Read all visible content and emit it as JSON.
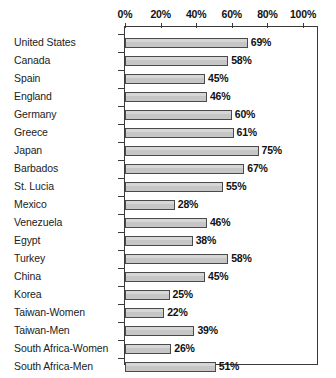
{
  "chart_data": {
    "type": "bar",
    "orientation": "horizontal",
    "title": "",
    "xlabel": "",
    "ylabel": "",
    "xlim": [
      0,
      100
    ],
    "xtick_labels": [
      "0%",
      "20%",
      "40%",
      "60%",
      "80%",
      "100%"
    ],
    "xticks": [
      0,
      20,
      40,
      60,
      80,
      100
    ],
    "grid": false,
    "legend": "none",
    "value_suffix": "%",
    "bar_fill_color": "#c6c6c6",
    "bar_border_color": "#4a4a4a",
    "axis_color": "#3a3a3a",
    "categories": [
      "United States",
      "Canada",
      "Spain",
      "England",
      "Germany",
      "Greece",
      "Japan",
      "Barbados",
      "St. Lucia",
      "Mexico",
      "Venezuela",
      "Egypt",
      "Turkey",
      "China",
      "Korea",
      "Taiwan-Women",
      "Taiwan-Men",
      "South Africa-Women",
      "South Africa-Men"
    ],
    "values": [
      69,
      58,
      45,
      46,
      60,
      61,
      75,
      67,
      55,
      28,
      46,
      38,
      58,
      45,
      25,
      22,
      39,
      26,
      51
    ],
    "value_labels": [
      "69%",
      "58%",
      "45%",
      "46%",
      "60%",
      "61%",
      "75%",
      "67%",
      "55%",
      "28%",
      "46%",
      "38%",
      "58%",
      "45%",
      "25%",
      "22%",
      "39%",
      "26%",
      "51%"
    ]
  }
}
